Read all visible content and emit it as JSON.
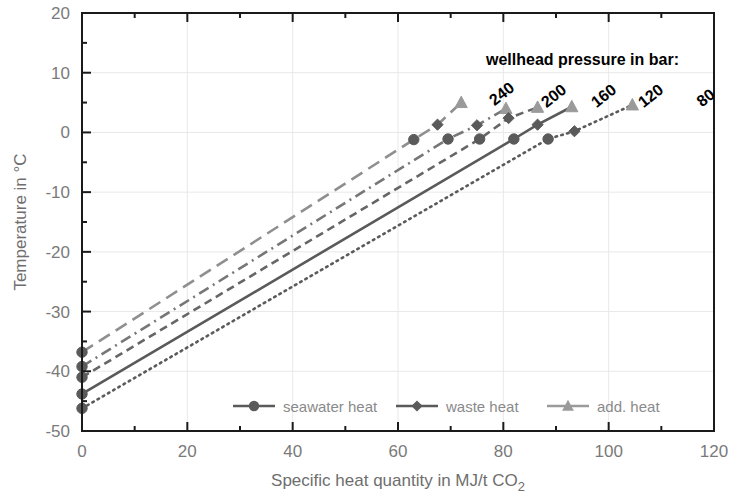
{
  "chart_data": {
    "type": "line",
    "title": "",
    "xlabel": "Specific heat quantity in MJ/t CO2",
    "ylabel": "Temperature in °C",
    "xlim": [
      0,
      120
    ],
    "ylim": [
      -50,
      20
    ],
    "xticks": [
      0,
      20,
      40,
      60,
      80,
      100,
      120
    ],
    "xtick_labels": [
      "0",
      "20",
      "40",
      "60",
      "80",
      "100",
      "120"
    ],
    "xminor_step": 10,
    "yticks": [
      -50,
      -40,
      -30,
      -20,
      -10,
      0,
      10,
      20
    ],
    "ytick_labels": [
      "-50",
      "-40",
      "-30",
      "-20",
      "-10",
      "0",
      "10",
      "20"
    ],
    "yminor_step": 5,
    "grid": true,
    "grid_color": "#e8e8e8",
    "legend_position": "inside-bottom-center",
    "annotation_title": "wellhead pressure in bar:",
    "series": [
      {
        "name": "240",
        "label": "240",
        "linestyle": "longdash",
        "color": "#8f8f8f",
        "points": [
          {
            "x": 0,
            "y": -36.8,
            "marker": "none"
          },
          {
            "x": 63.0,
            "y": -1.2,
            "marker": "circle"
          },
          {
            "x": 67.5,
            "y": 1.3,
            "marker": "diamond"
          },
          {
            "x": 72.0,
            "y": 5.0,
            "marker": "triangle"
          }
        ]
      },
      {
        "name": "200",
        "label": "200",
        "linestyle": "dashdot",
        "color": "#777777",
        "points": [
          {
            "x": 0,
            "y": -39.2,
            "marker": "none"
          },
          {
            "x": 69.5,
            "y": -1.1,
            "marker": "circle"
          },
          {
            "x": 75.0,
            "y": 1.2,
            "marker": "diamond"
          },
          {
            "x": 80.5,
            "y": 4.0,
            "marker": "triangle"
          }
        ]
      },
      {
        "name": "160",
        "label": "160",
        "linestyle": "dash",
        "color": "#666666",
        "points": [
          {
            "x": 0,
            "y": -41.0,
            "marker": "none"
          },
          {
            "x": 75.5,
            "y": -1.1,
            "marker": "circle"
          },
          {
            "x": 81.0,
            "y": 2.4,
            "marker": "diamond"
          },
          {
            "x": 86.5,
            "y": 4.2,
            "marker": "triangle"
          }
        ]
      },
      {
        "name": "120",
        "label": "120",
        "linestyle": "solid",
        "color": "#5a5a5a",
        "points": [
          {
            "x": 0,
            "y": -43.8,
            "marker": "none"
          },
          {
            "x": 82.0,
            "y": -1.1,
            "marker": "circle"
          },
          {
            "x": 86.5,
            "y": 1.3,
            "marker": "diamond"
          },
          {
            "x": 93.0,
            "y": 4.3,
            "marker": "triangle"
          }
        ]
      },
      {
        "name": "80",
        "label": "80",
        "linestyle": "dot",
        "color": "#5a5a5a",
        "points": [
          {
            "x": 0,
            "y": -46.2,
            "marker": "none"
          },
          {
            "x": 88.5,
            "y": -1.1,
            "marker": "circle"
          },
          {
            "x": 93.5,
            "y": 0.2,
            "marker": "diamond"
          },
          {
            "x": 104.5,
            "y": 4.6,
            "marker": "triangle"
          }
        ]
      }
    ],
    "legend": [
      {
        "label": "seawater heat",
        "marker": "circle",
        "color": "#5a5a5a"
      },
      {
        "label": "waste heat",
        "marker": "diamond",
        "color": "#5a5a5a"
      },
      {
        "label": "add. heat",
        "marker": "triangle",
        "color": "#9a9a9a"
      }
    ]
  },
  "axes": {
    "x_title_main": "Specific heat quantity in MJ/t CO",
    "x_title_sub": "2",
    "y_title": "Temperature in °C"
  }
}
